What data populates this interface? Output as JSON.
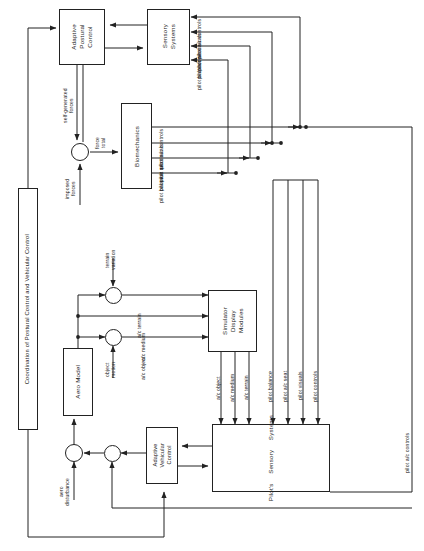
{
  "diagram": {
    "title": "Coordination of Postural Control and Vehicular Control",
    "orientation": "rotated-90",
    "line_color": "#222222",
    "background": "#ffffff",
    "nodes": [
      {
        "id": "coordination",
        "label": "Coordination of Postural Control  and Vehicular Control"
      },
      {
        "id": "adaptive_postural",
        "label": "Adaptive\nPostural\nControl"
      },
      {
        "id": "sensory_systems",
        "label": "Sensory\nSystems"
      },
      {
        "id": "biomechanics",
        "label": "Biomechanics"
      },
      {
        "id": "aero_model",
        "label": "Aero Model"
      },
      {
        "id": "simulator_display",
        "label": "Simulator\nDisplay\nModules"
      },
      {
        "id": "pilots_sensory",
        "label": "Pilot's     Sensory     Systems"
      },
      {
        "id": "adaptive_vehicular",
        "label": "Adaptive\nVehicular\nControl"
      }
    ],
    "node_labels": {
      "coordination": "Coordination of Postural Control  and Vehicular Control",
      "adaptive_postural_1": "Adaptive",
      "adaptive_postural_2": "Postural",
      "adaptive_postural_3": "Control",
      "sensory_systems_1": "Sensory",
      "sensory_systems_2": "Systems",
      "biomechanics": "Biomechanics",
      "aero_model": "Aero Model",
      "simulator_display_1": "Simulator",
      "simulator_display_2": "Display",
      "simulator_display_3": "Modules",
      "pilots_sensory_1": "Pilot's",
      "pilots_sensory_2": "Sensory",
      "pilots_sensory_3": "Systems",
      "adaptive_vehicular_1": "Adaptive",
      "adaptive_vehicular_2": "Vehicular",
      "adaptive_vehicular_3": "Control"
    },
    "signal_labels": {
      "self_generated_forces": "self-generated\nforces",
      "self_generated_1": "self-generated",
      "self_generated_2": "forces",
      "imposed_1": "imposed",
      "imposed_2": "forces",
      "total_1": "total",
      "total_2": "force",
      "terrain_variation_1": "terrain",
      "terrain_variation_2": "variation",
      "object_motion_1": "object",
      "object_motion_2": "motion",
      "aero_disturbance_1": "aero",
      "aero_disturbance_2": "disturbance"
    },
    "sensory_inputs_top": [
      "pilot  a/c  controls",
      "pilot  a/c  visuals",
      "pilot  a/c  seat",
      "pilot  balance"
    ],
    "biomechanics_outputs": [
      "pilot  a/c  controls",
      "pilot  a/c  visuals",
      "pilot  a/c  seat",
      "pilot  balance"
    ],
    "aero_to_display": [
      "a/c   terrain",
      "a/c   medium",
      "a/c   object"
    ],
    "display_to_pilot": [
      "a/c   object",
      "a/c   medium",
      "a/c   terrain"
    ],
    "pilot_sensory_inputs": [
      "pilot   balance",
      "pilot  a/c  seat",
      "pilot   visuals",
      "pilot   controls"
    ],
    "far_right_label": "pilot  a/c  controls"
  }
}
